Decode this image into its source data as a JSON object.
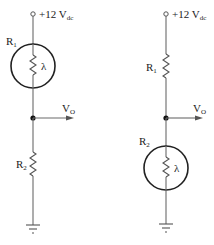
{
  "colors": {
    "wire": "#6a6a6a",
    "ring": "#222222",
    "text": "#222222",
    "background": "#ffffff"
  },
  "circuits": [
    {
      "name": "left",
      "supply": {
        "label": "+12 V",
        "subscript": "dc"
      },
      "r1": {
        "label": "R",
        "subscript": "1",
        "type": "photoresistor",
        "symbol": "λ"
      },
      "output": {
        "label": "V",
        "subscript": "O"
      },
      "r2": {
        "label": "R",
        "subscript": "2",
        "type": "resistor"
      },
      "ground": "ground-icon"
    },
    {
      "name": "right",
      "supply": {
        "label": "+12 V",
        "subscript": "dc"
      },
      "r1": {
        "label": "R",
        "subscript": "1",
        "type": "resistor"
      },
      "output": {
        "label": "V",
        "subscript": "O"
      },
      "r2": {
        "label": "R",
        "subscript": "2",
        "type": "photoresistor",
        "symbol": "λ"
      },
      "ground": "ground-icon"
    }
  ]
}
